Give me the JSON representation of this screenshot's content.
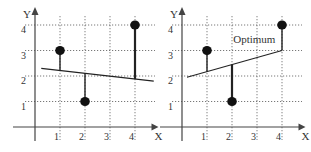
{
  "chart_data": [
    {
      "type": "scatter",
      "title": "",
      "xlabel": "X",
      "ylabel": "Y",
      "xticks": [
        "1",
        "2",
        "3",
        "4"
      ],
      "yticks": [
        "1",
        "2",
        "3",
        "4"
      ],
      "xlim": [
        0,
        4.8
      ],
      "ylim": [
        0,
        4.4
      ],
      "grid": true,
      "points": [
        {
          "x": 1,
          "y": 3
        },
        {
          "x": 2,
          "y": 1
        },
        {
          "x": 4,
          "y": 4
        }
      ],
      "line": {
        "x0": 0.25,
        "y0": 2.3,
        "x1": 4.75,
        "y1": 1.8,
        "label": ""
      },
      "residuals": true
    },
    {
      "type": "scatter",
      "title": "",
      "xlabel": "X",
      "ylabel": "Y",
      "xticks": [
        "1",
        "2",
        "3",
        "4"
      ],
      "yticks": [
        "1",
        "2",
        "3",
        "4"
      ],
      "xlim": [
        0,
        4.8
      ],
      "ylim": [
        0,
        4.4
      ],
      "grid": true,
      "points": [
        {
          "x": 1,
          "y": 3
        },
        {
          "x": 2,
          "y": 1
        },
        {
          "x": 4,
          "y": 4
        }
      ],
      "line": {
        "x0": 0.2,
        "y0": 1.95,
        "x1": 4.0,
        "y1": 3.0,
        "label": "Optimum"
      },
      "annotation": "Optimum",
      "residuals": true
    }
  ]
}
